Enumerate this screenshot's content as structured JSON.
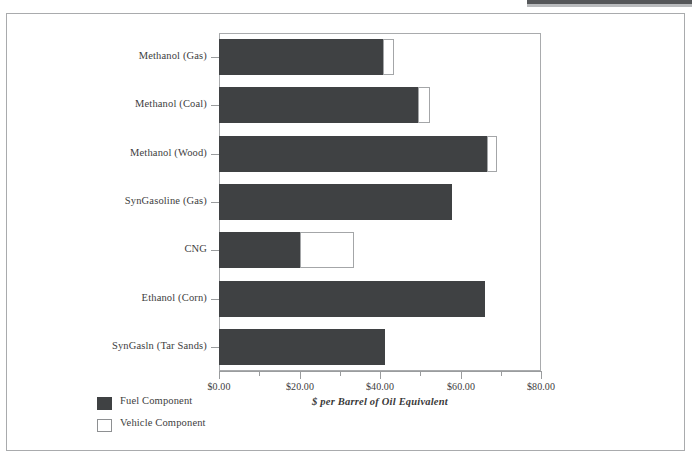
{
  "chart_data": {
    "type": "bar",
    "orientation": "horizontal",
    "stacked": true,
    "title": "",
    "xlabel": "$ per Barrel of Oil Equivalent",
    "ylabel": "",
    "xlim": [
      0,
      80
    ],
    "xticks": [
      0,
      20,
      40,
      60,
      80
    ],
    "xtick_labels": [
      "$0.00",
      "$20.00",
      "$40.00",
      "$60.00",
      "$80.00"
    ],
    "minor_xticks": [
      10,
      30,
      50,
      70
    ],
    "grid": false,
    "legend_position": "bottom-left",
    "categories": [
      "Methanol (Gas)",
      "Methanol (Coal)",
      "Methanol (Wood)",
      "SynGasoline (Gas)",
      "CNG",
      "Ethanol (Corn)",
      "SynGasln (Tar Sands)"
    ],
    "series": [
      {
        "name": "Fuel Component",
        "color": "#3f4143",
        "values": [
          40.8,
          49.4,
          66.6,
          58.0,
          20.1,
          66.1,
          41.2
        ]
      },
      {
        "name": "Vehicle Component",
        "color": "#ffffff",
        "values": [
          2.6,
          3.0,
          2.5,
          0.0,
          13.4,
          0.0,
          0.0
        ]
      }
    ],
    "totals": [
      43.4,
      52.4,
      69.1,
      58.0,
      33.5,
      66.1,
      41.2
    ]
  },
  "legend": {
    "items": [
      {
        "label": "Fuel Component",
        "swatch": "fuel"
      },
      {
        "label": "Vehicle Component",
        "swatch": "vehicle"
      }
    ]
  },
  "colors": {
    "fuel": "#3f4143",
    "vehicle": "#ffffff",
    "axis": "#9a9c9e",
    "frame": "#a9abad",
    "text": "#3d3d3d"
  }
}
